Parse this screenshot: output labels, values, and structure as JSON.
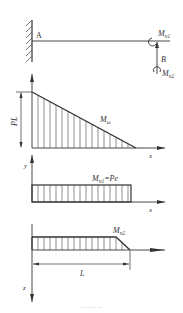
{
  "beam": {
    "point_a": "A",
    "point_b": "B",
    "moment_1": "M",
    "moment_1_sub": "n1",
    "moment_2": "M",
    "moment_2_sub": "n2"
  },
  "diagram_bending": {
    "height_label": "PL",
    "curve_label": "M",
    "curve_label_sub": "ω",
    "x_axis": "x"
  },
  "diagram_torsion": {
    "y_axis": "y",
    "label": "M",
    "label_sub": "n1",
    "label_eq": "=Pe",
    "x_axis": "x"
  },
  "diagram_moment2": {
    "label": "M",
    "label_sub": "n2",
    "length_label": "L",
    "z_axis": "z"
  },
  "caption": "· · · · · · · ·"
}
